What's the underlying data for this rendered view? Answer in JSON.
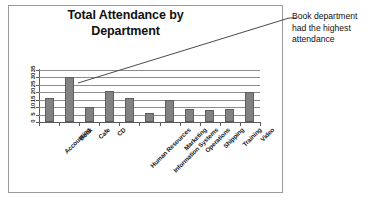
{
  "chart_data": {
    "type": "bar",
    "title": "Total Attendance by Department",
    "title_lines": [
      "Total Attendance by",
      "Department"
    ],
    "xlabel": "",
    "ylabel": "",
    "ylim": [
      0,
      35
    ],
    "ytick_step": 5,
    "grid": true,
    "legend": "none",
    "bar_color": "#828282",
    "categories": [
      "Accounting",
      "Book",
      "Cafe",
      "CD",
      "Human Resources",
      "Information Systems",
      "Marketing",
      "Operations",
      "Shipping",
      "Training",
      "Video"
    ],
    "values": [
      16,
      30,
      10,
      21,
      16,
      6,
      15,
      9,
      8,
      9,
      20
    ],
    "yticks": [
      0,
      5,
      10,
      15,
      20,
      25,
      30,
      35
    ],
    "ytick_labels": [
      "0",
      "5",
      "10",
      "15",
      "20",
      "25",
      "30",
      "35"
    ],
    "annotations": [
      {
        "text": "Book department had the highest attendance",
        "lines": [
          "Book department",
          "had the highest",
          "attendance"
        ],
        "points_to": "Book"
      }
    ]
  },
  "colors": {
    "bar_fill": "#828282",
    "bar_stroke": "#5e5e5e",
    "gridline": "#8c8c8c",
    "axis": "#5a5a5a",
    "frame": "#9a9a9a",
    "text": "#1a1a1a",
    "background": "#ffffff"
  }
}
